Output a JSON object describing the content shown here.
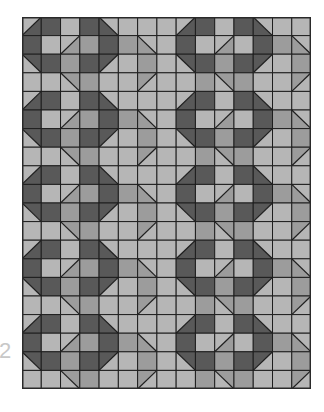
{
  "figure": {
    "label": "2",
    "grid": {
      "cols": 15,
      "rows": 20,
      "cell_w": 19.27,
      "cell_h": 18.6
    },
    "colors": {
      "D": "#595959",
      "M": "#9c9c9c",
      "L": "#b6b6b6",
      "line": "#1e1e1e",
      "border": "#2a2a2a"
    },
    "legend_codes": {
      "D": "dark",
      "M": "medium",
      "L": "light",
      "/": "half-square triangle, diagonal bottom-left to top-right",
      "\\": "half-square triangle, diagonal top-left to bottom-right"
    },
    "pattern_rows": [
      [
        "/:L:D",
        "D",
        "L",
        "D",
        "\\:L:D",
        "L",
        "L",
        "L",
        "/:L:D",
        "D",
        "L",
        "D",
        "\\:L:D",
        "L",
        "L"
      ],
      [
        "D",
        "L",
        "/:L:M",
        "M",
        "D",
        "M",
        "\\:L:M",
        "L",
        "D",
        "L",
        "/:L:M",
        "L",
        "D",
        "M",
        "\\:L:M"
      ],
      [
        "\\:D:L",
        "D",
        "M",
        "D",
        "/:D:L",
        "L",
        "M",
        "L",
        "\\:D:L",
        "D",
        "M",
        "D",
        "/:D:L",
        "L",
        "M"
      ],
      [
        "L",
        "L",
        "\\:M:L",
        "M",
        "L",
        "L",
        "/:M:L",
        "L",
        "L",
        "M",
        "\\:M:L",
        "M",
        "L",
        "L",
        "/:M:L"
      ]
    ],
    "repeat_vertical": 5
  }
}
